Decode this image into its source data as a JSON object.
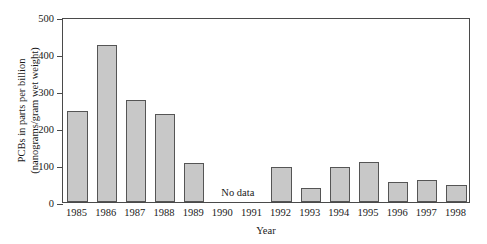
{
  "chart_data": {
    "type": "bar",
    "title": "",
    "xlabel": "Year",
    "ylabel": "PCBs in parts per billion (nanograms/gram wet weight)",
    "ylabel_lines": [
      "PCBs in parts per billion",
      "(nanograms/gram wet weight)"
    ],
    "categories": [
      "1985",
      "1986",
      "1987",
      "1988",
      "1989",
      "1990",
      "1991",
      "1992",
      "1993",
      "1994",
      "1995",
      "1996",
      "1997",
      "1998"
    ],
    "values": [
      245,
      425,
      275,
      237,
      105,
      null,
      null,
      94,
      38,
      94,
      109,
      53,
      60,
      45
    ],
    "ylim": [
      0,
      500
    ],
    "yticks": [
      0,
      100,
      200,
      300,
      400,
      500
    ],
    "ytick_labels": [
      "0",
      "100",
      "200",
      "300",
      "400",
      "500"
    ],
    "grid": false,
    "legend": null,
    "annotations": [
      {
        "text": "No data",
        "categories": [
          "1990",
          "1991"
        ],
        "value": 30
      }
    ],
    "colors": {
      "bar_fill": "#c8c8c8",
      "bar_edge": "#555555",
      "frame": "#4a4a4a",
      "text": "#1a1a1a",
      "background": "#ffffff"
    }
  }
}
